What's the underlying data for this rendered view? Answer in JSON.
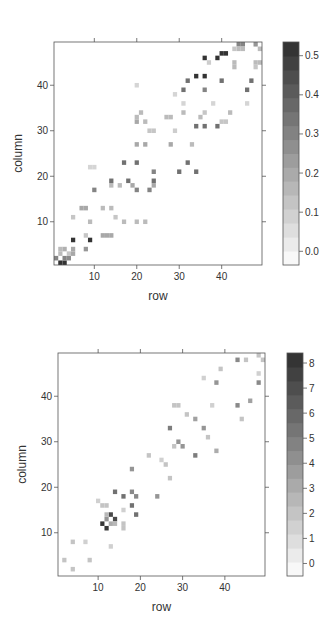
{
  "chart_data": [
    {
      "type": "heatmap",
      "title": "",
      "xlabel": "row",
      "ylabel": "column",
      "x_ticks": [
        10,
        20,
        30,
        40
      ],
      "y_ticks": [
        10,
        20,
        30,
        40
      ],
      "xlim": [
        0.5,
        49.5
      ],
      "ylim": [
        0.5,
        49.5
      ],
      "colorbar": {
        "ticks": [
          "0.0",
          "0.1",
          "0.2",
          "0.3",
          "0.4",
          "0.5"
        ],
        "tick_values": [
          0.0,
          0.1,
          0.2,
          0.3,
          0.4,
          0.5
        ],
        "range": [
          -0.035,
          0.535
        ]
      },
      "cells": [
        [
          2,
          1,
          0.52
        ],
        [
          3,
          1,
          0.52
        ],
        [
          1,
          2,
          0.3
        ],
        [
          3,
          2,
          0.3
        ],
        [
          4,
          2,
          0.28
        ],
        [
          2,
          3,
          0.15
        ],
        [
          4,
          3,
          0.12
        ],
        [
          2,
          4,
          0.15
        ],
        [
          3,
          4,
          0.18
        ],
        [
          5,
          4,
          0.2
        ],
        [
          5,
          3,
          0.2
        ],
        [
          5,
          6,
          0.52
        ],
        [
          9,
          6,
          0.52
        ],
        [
          8,
          4,
          0.25
        ],
        [
          8,
          7,
          0.12
        ],
        [
          12,
          7,
          0.2
        ],
        [
          13,
          7,
          0.2
        ],
        [
          14,
          7,
          0.2
        ],
        [
          9,
          10,
          0.15
        ],
        [
          17,
          10,
          0.15
        ],
        [
          20,
          10,
          0.15
        ],
        [
          22,
          10,
          0.15
        ],
        [
          5,
          11,
          0.12
        ],
        [
          15,
          11,
          0.12
        ],
        [
          7,
          13,
          0.2
        ],
        [
          8,
          13,
          0.2
        ],
        [
          12,
          13,
          0.15
        ],
        [
          14,
          13,
          0.15
        ],
        [
          10,
          17,
          0.3
        ],
        [
          16,
          18,
          0.15
        ],
        [
          14,
          18,
          0.15
        ],
        [
          14,
          19,
          0.35
        ],
        [
          18,
          19,
          0.35
        ],
        [
          19,
          18,
          0.2
        ],
        [
          20,
          17,
          0.3
        ],
        [
          23,
          17,
          0.3
        ],
        [
          24,
          19,
          0.35
        ],
        [
          24,
          18,
          0.2
        ],
        [
          24,
          21,
          0.3
        ],
        [
          17,
          23,
          0.35
        ],
        [
          20,
          23,
          0.35
        ],
        [
          30,
          21,
          0.35
        ],
        [
          34,
          21,
          0.35
        ],
        [
          32,
          23,
          0.35
        ],
        [
          9,
          22,
          0.08
        ],
        [
          10,
          22,
          0.08
        ],
        [
          20,
          27,
          0.2
        ],
        [
          22,
          27,
          0.2
        ],
        [
          28,
          27,
          0.2
        ],
        [
          33,
          27,
          0.15
        ],
        [
          23,
          30,
          0.12
        ],
        [
          24,
          30,
          0.12
        ],
        [
          29,
          30,
          0.1
        ],
        [
          34,
          31,
          0.35
        ],
        [
          36,
          31,
          0.35
        ],
        [
          39,
          31,
          0.35
        ],
        [
          22,
          32,
          0.15
        ],
        [
          20,
          32,
          0.2
        ],
        [
          20,
          33,
          0.15
        ],
        [
          27,
          33,
          0.15
        ],
        [
          28,
          33,
          0.15
        ],
        [
          35,
          33,
          0.15
        ],
        [
          21,
          34,
          0.15
        ],
        [
          31,
          34,
          0.15
        ],
        [
          36,
          34,
          0.12
        ],
        [
          42,
          34,
          0.15
        ],
        [
          40,
          32,
          0.12
        ],
        [
          41,
          32,
          0.12
        ],
        [
          38,
          36,
          0.08
        ],
        [
          46,
          36,
          0.08
        ],
        [
          31,
          36,
          0.08
        ],
        [
          31,
          39,
          0.35
        ],
        [
          36,
          39,
          0.3
        ],
        [
          46,
          39,
          0.35
        ],
        [
          32,
          41,
          0.35
        ],
        [
          40,
          41,
          0.35
        ],
        [
          47,
          41,
          0.35
        ],
        [
          29,
          38,
          0.08
        ],
        [
          20,
          40,
          0.08
        ],
        [
          34,
          42,
          0.52
        ],
        [
          36,
          42,
          0.52
        ],
        [
          36,
          46,
          0.52
        ],
        [
          39,
          46,
          0.52
        ],
        [
          40,
          47,
          0.52
        ],
        [
          41,
          47,
          0.52
        ],
        [
          37,
          45,
          0.1
        ],
        [
          43,
          45,
          0.15
        ],
        [
          48,
          45,
          0.15
        ],
        [
          49,
          45,
          0.15
        ],
        [
          43,
          44,
          0.15
        ],
        [
          48,
          44,
          0.12
        ],
        [
          44,
          49,
          0.3
        ],
        [
          45,
          49,
          0.3
        ],
        [
          48,
          49,
          0.25
        ],
        [
          44,
          48,
          0.15
        ],
        [
          45,
          48,
          0.15
        ],
        [
          43,
          48,
          0.12
        ],
        [
          49,
          48,
          0.15
        ]
      ]
    },
    {
      "type": "heatmap",
      "title": "",
      "xlabel": "row",
      "ylabel": "column",
      "x_ticks": [
        10,
        20,
        30,
        40
      ],
      "y_ticks": [
        10,
        20,
        30,
        40
      ],
      "xlim": [
        0.5,
        49.5
      ],
      "ylim": [
        0.5,
        49.5
      ],
      "colorbar": {
        "ticks": [
          "0",
          "1",
          "2",
          "3",
          "4",
          "5",
          "6",
          "7",
          "8"
        ],
        "tick_values": [
          0,
          1,
          2,
          3,
          4,
          5,
          6,
          7,
          8
        ],
        "range": [
          -0.5,
          8.4
        ]
      },
      "cells": [
        [
          11,
          12,
          8
        ],
        [
          12,
          11,
          8
        ],
        [
          13,
          14,
          7.2
        ],
        [
          14,
          13,
          7.2
        ],
        [
          12,
          13,
          4
        ],
        [
          13,
          12,
          3
        ],
        [
          12,
          14,
          2.5
        ],
        [
          14,
          12,
          2.5
        ],
        [
          14,
          19,
          5.5
        ],
        [
          16,
          18,
          5.5
        ],
        [
          18,
          19,
          4.5
        ],
        [
          18,
          16,
          5.5
        ],
        [
          19,
          18,
          4.5
        ],
        [
          19,
          14,
          5.5
        ],
        [
          18,
          24,
          4
        ],
        [
          24,
          18,
          4
        ],
        [
          11,
          16,
          2
        ],
        [
          12,
          16,
          2
        ],
        [
          16,
          12,
          2
        ],
        [
          16,
          11,
          2
        ],
        [
          10,
          17,
          1.5
        ],
        [
          16,
          15,
          1.5
        ],
        [
          13,
          7,
          1.5
        ],
        [
          2,
          4,
          2
        ],
        [
          4,
          2,
          2
        ],
        [
          4,
          8,
          2
        ],
        [
          8,
          4,
          2
        ],
        [
          7,
          8,
          1.5
        ],
        [
          22,
          27,
          2
        ],
        [
          26,
          25,
          2
        ],
        [
          25,
          26,
          1.5
        ],
        [
          27,
          22,
          2
        ],
        [
          27,
          33,
          5
        ],
        [
          33,
          27,
          5
        ],
        [
          29,
          30,
          4
        ],
        [
          30,
          29,
          4
        ],
        [
          28,
          29,
          2
        ],
        [
          33,
          35,
          3.5
        ],
        [
          35,
          33,
          4
        ],
        [
          36,
          31,
          2
        ],
        [
          31,
          36,
          2
        ],
        [
          28,
          38,
          2
        ],
        [
          29,
          38,
          2
        ],
        [
          38,
          28,
          3
        ],
        [
          37,
          38,
          1.5
        ],
        [
          38,
          43,
          4
        ],
        [
          43,
          38,
          4.5
        ],
        [
          46,
          39,
          3.5
        ],
        [
          44,
          35,
          2
        ],
        [
          39,
          46,
          2
        ],
        [
          43,
          48,
          4.5
        ],
        [
          45,
          48,
          2
        ],
        [
          48,
          43,
          4.5
        ],
        [
          48,
          49,
          2
        ],
        [
          49,
          48,
          2
        ],
        [
          48,
          45,
          1.5
        ],
        [
          35,
          44,
          1.5
        ]
      ]
    }
  ],
  "charts_layout": [
    {
      "panel": {
        "x": 54,
        "y": 42,
        "w": 208,
        "h": 223
      },
      "colorbar": {
        "x": 283,
        "y": 42,
        "w": 16,
        "h": 223
      },
      "xlabel_y": 300,
      "ylabel_x": 22
    },
    {
      "panel": {
        "x": 58,
        "y": 353,
        "w": 207,
        "h": 223
      },
      "colorbar": {
        "x": 287,
        "y": 353,
        "w": 16,
        "h": 223
      },
      "xlabel_y": 611,
      "ylabel_x": 26
    }
  ]
}
